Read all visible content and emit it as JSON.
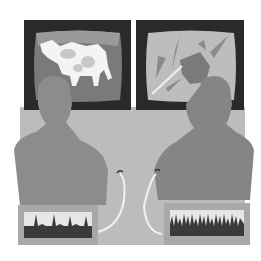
{
  "illustration": {
    "description": "Two silhouetted people viewing screens while connected to waveform monitors",
    "colors": {
      "background": "#ffffff",
      "bezel": "#2a2a2a",
      "screen_left": "#7a7a7a",
      "screen_right": "#bdbdbd",
      "desk": "#bcbcbc",
      "person_left": "#8c8c8c",
      "person_right": "#858585",
      "monitor_box": "#a8a8a8",
      "trace_fill": "#3a3a3a",
      "trace_bg": "#e6e6e6",
      "wire": "#f2f2f2"
    },
    "left_screen": {
      "content": "cow-image"
    },
    "right_screen": {
      "content": "violent-action-image"
    },
    "left_monitor": {
      "waveform": "low-frequency-spikes"
    },
    "right_monitor": {
      "waveform": "high-frequency-spikes"
    }
  }
}
